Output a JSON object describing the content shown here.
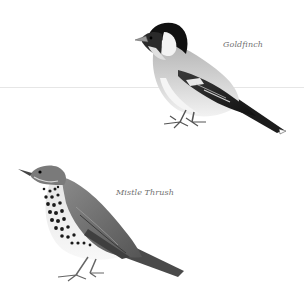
{
  "plate": {
    "background": "#ffffff",
    "birds": [
      {
        "id": "goldfinch",
        "label": "Goldfinch"
      },
      {
        "id": "mistle-thrush",
        "label": "Mistle Thrush"
      }
    ]
  },
  "colors": {
    "label_text": "#6f6f6f",
    "fold_line": "#e6e6e6",
    "ink_dark": "#1a1a1a",
    "ink_mid": "#777777",
    "ink_light": "#c8c8c8"
  }
}
